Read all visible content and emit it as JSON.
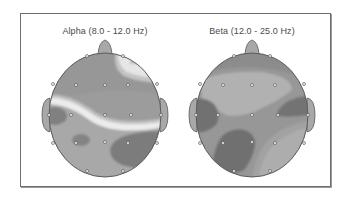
{
  "figure": {
    "type": "eeg-topographic-map",
    "panels": [
      {
        "id": "alpha",
        "title": "Alpha (8.0 - 12.0 Hz)",
        "band": "Alpha",
        "freq_range_hz": [
          8.0,
          12.0
        ],
        "regions": [
          {
            "name": "frontal-right-high",
            "level": "very-high"
          },
          {
            "name": "frontal-midline",
            "level": "medium"
          },
          {
            "name": "diagonal-ridge-band",
            "level": "very-high"
          },
          {
            "name": "left-temporal",
            "level": "low"
          },
          {
            "name": "left-parietal-spot",
            "level": "low"
          },
          {
            "name": "right-posterior",
            "level": "low"
          },
          {
            "name": "posterior-left",
            "level": "medium-high"
          }
        ]
      },
      {
        "id": "beta",
        "title": "Beta (12.0 - 25.0 Hz)",
        "band": "Beta",
        "freq_range_hz": [
          12.0,
          25.0
        ],
        "regions": [
          {
            "name": "frontal-band",
            "level": "medium-low"
          },
          {
            "name": "central-plateau",
            "level": "high"
          },
          {
            "name": "left-temporal",
            "level": "low"
          },
          {
            "name": "right-temporal",
            "level": "low"
          },
          {
            "name": "left-posterior",
            "level": "low"
          },
          {
            "name": "right-posterior-arc",
            "level": "high"
          }
        ]
      }
    ],
    "electrode_count": 19,
    "colors": {
      "very_high": "#ececec",
      "high": "#b3b3b3",
      "medium": "#9c9c9c",
      "medium_low": "#8e8e8e",
      "low": "#747474",
      "outline": "#5c5c5c",
      "electrode": "#efefef",
      "frame": "#6e6e6e",
      "title_text": "#4a4a4a"
    }
  }
}
